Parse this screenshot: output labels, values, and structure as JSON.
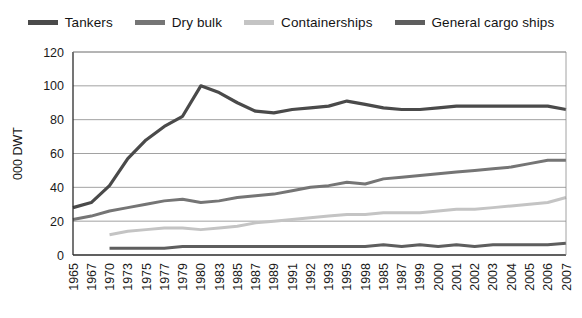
{
  "chart_data": {
    "type": "line",
    "title": "",
    "xlabel": "",
    "ylabel": "000 DWT",
    "ylim": [
      0,
      120
    ],
    "yticks": [
      0,
      20,
      40,
      60,
      80,
      100,
      120
    ],
    "grid": true,
    "legend_position": "top-center",
    "categories": [
      "1965",
      "1967",
      "1970",
      "1973",
      "1975",
      "1977",
      "1979",
      "1980",
      "1983",
      "1985",
      "1987",
      "1989",
      "1991",
      "1992",
      "1993",
      "1995",
      "1998",
      "1985",
      "1987",
      "1999",
      "2000",
      "2001",
      "2002",
      "2003",
      "2004",
      "2005",
      "2006",
      "2007"
    ],
    "series": [
      {
        "name": "Tankers",
        "color": "#4a4a4a",
        "values": [
          28,
          31,
          41,
          57,
          68,
          76,
          82,
          100,
          96,
          90,
          85,
          84,
          86,
          87,
          88,
          91,
          89,
          87,
          86,
          86,
          87,
          88,
          88,
          88,
          88,
          88,
          88,
          86
        ]
      },
      {
        "name": "Dry bulk",
        "color": "#757575",
        "values": [
          21,
          23,
          26,
          28,
          30,
          32,
          33,
          31,
          32,
          34,
          35,
          36,
          38,
          40,
          41,
          43,
          42,
          45,
          46,
          47,
          48,
          49,
          50,
          51,
          52,
          54,
          56,
          56
        ]
      },
      {
        "name": "Containerships",
        "color": "#c4c4c4",
        "values": [
          null,
          null,
          12,
          14,
          15,
          16,
          16,
          15,
          16,
          17,
          19,
          20,
          21,
          22,
          23,
          24,
          24,
          25,
          25,
          25,
          26,
          27,
          27,
          28,
          29,
          30,
          31,
          34
        ]
      },
      {
        "name": "General cargo ships",
        "color": "#5e5e5e",
        "values": [
          null,
          null,
          4,
          4,
          4,
          4,
          5,
          5,
          5,
          5,
          5,
          5,
          5,
          5,
          5,
          5,
          5,
          6,
          5,
          6,
          5,
          6,
          5,
          6,
          6,
          6,
          6,
          7
        ]
      }
    ]
  },
  "legend": {
    "items": [
      {
        "label": "Tankers",
        "color": "#4a4a4a"
      },
      {
        "label": "Dry bulk",
        "color": "#757575"
      },
      {
        "label": "Containerships",
        "color": "#c4c4c4"
      },
      {
        "label": "General cargo ships",
        "color": "#5e5e5e"
      }
    ]
  },
  "axes": {
    "y_title": "000 DWT"
  }
}
